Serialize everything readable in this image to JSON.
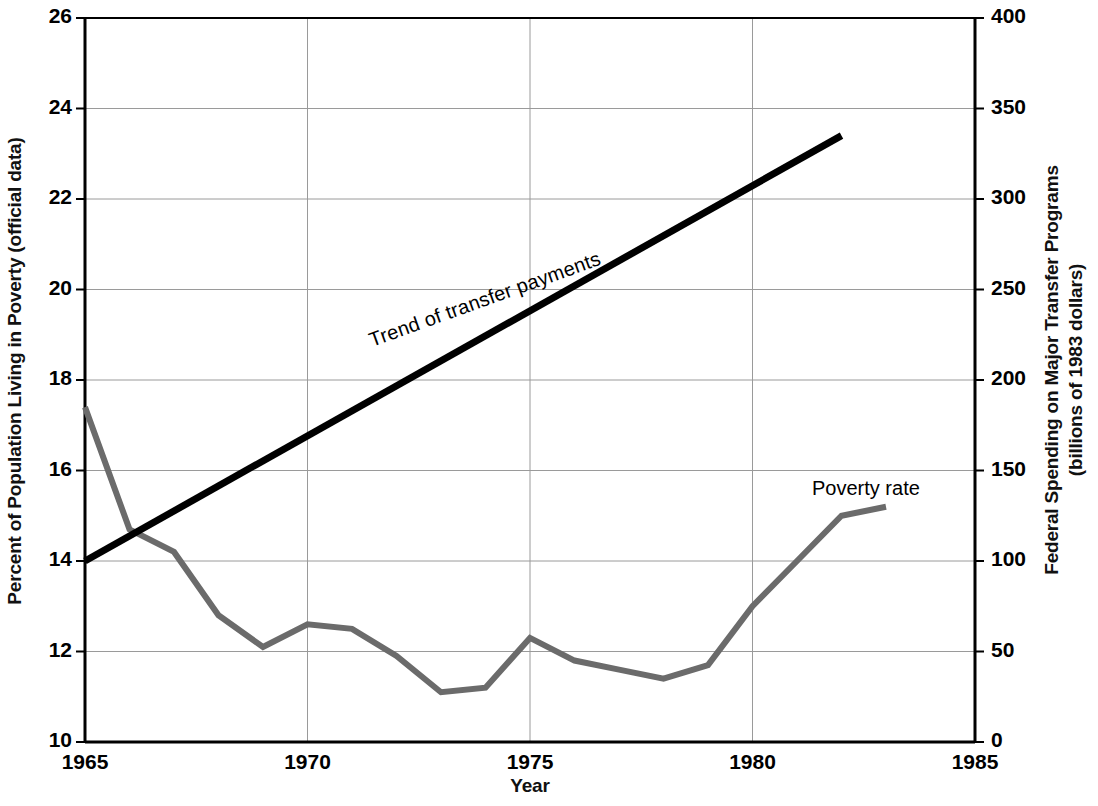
{
  "chart_data": {
    "type": "line",
    "title": "",
    "xlabel": "Year",
    "ylabel_left": "Percent of Population Living in Poverty (official data)",
    "ylabel_right_line1": "Federal Spending on Major Transfer Programs",
    "ylabel_right_line2": "(billions of 1983 dollars)",
    "xlim": [
      1965,
      1985
    ],
    "ylim_left": [
      10,
      26
    ],
    "ylim_right": [
      0,
      400
    ],
    "xticks": [
      "1965",
      "1970",
      "1975",
      "1980",
      "1985"
    ],
    "xtick_values": [
      1965,
      1970,
      1975,
      1980,
      1985
    ],
    "yticks_left": [
      "10",
      "12",
      "14",
      "16",
      "18",
      "20",
      "22",
      "24",
      "26"
    ],
    "ytick_values_left": [
      10,
      12,
      14,
      16,
      18,
      20,
      22,
      24,
      26
    ],
    "yticks_right": [
      "0",
      "50",
      "100",
      "150",
      "200",
      "250",
      "300",
      "350",
      "400"
    ],
    "ytick_values_right": [
      0,
      50,
      100,
      150,
      200,
      250,
      300,
      350,
      400
    ],
    "grid": true,
    "legend_position": "inline-annotations",
    "series": [
      {
        "name": "Poverty rate",
        "axis": "left",
        "color": "#6b6b6b",
        "x": [
          1965,
          1966,
          1967,
          1968,
          1969,
          1970,
          1971,
          1972,
          1973,
          1974,
          1975,
          1976,
          1977,
          1978,
          1979,
          1980,
          1981,
          1982,
          1983
        ],
        "values": [
          17.4,
          14.7,
          14.2,
          12.8,
          12.1,
          12.6,
          12.5,
          11.9,
          11.1,
          11.2,
          12.3,
          11.8,
          11.6,
          11.4,
          11.7,
          13.0,
          14.0,
          15.0,
          15.2
        ]
      },
      {
        "name": "Trend of transfer payments",
        "axis": "right",
        "color": "#000000",
        "x": [
          1965,
          1982
        ],
        "values": [
          100,
          335
        ]
      }
    ],
    "annotations": [
      {
        "text": "Trend of transfer payments",
        "x": 1971.2,
        "y_right": 215,
        "rotation": -19.8
      },
      {
        "text": "Poverty rate",
        "x": 1981.5,
        "y_left": 14.9
      }
    ]
  },
  "axes": {
    "left_title": "Percent of Population Living in Poverty (official data)",
    "right_title_line1": "Federal Spending on Major Transfer Programs",
    "right_title_line2": "(billions of 1983 dollars)",
    "x_title": "Year"
  },
  "labels": {
    "trend": "Trend of transfer payments",
    "poverty": "Poverty rate"
  },
  "colors": {
    "poverty_line": "#6b6b6b",
    "trend_line": "#000000",
    "axis": "#000000",
    "grid": "#9a9a9a",
    "background": "#ffffff"
  }
}
